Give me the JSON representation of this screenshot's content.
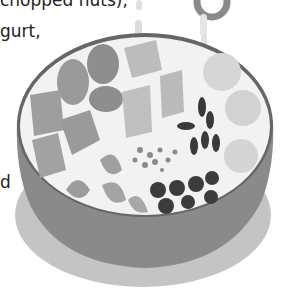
{
  "text_fragments": {
    "line1": "chopped nuts),",
    "line2": "gurt,",
    "line3": "d"
  },
  "illustration": {
    "subject": "bowl of yogurt with toppings",
    "toppings": [
      "mango cubes",
      "plums/eggs",
      "pineapple chunks",
      "banana slices",
      "raisins",
      "blueberries",
      "strawberries",
      "chopped nuts/seeds"
    ],
    "style": "grayscale"
  },
  "colors": {
    "bowl_side": "#8a8a8a",
    "bowl_shadow": "#c4c4c4",
    "bowl_rim": "#666666",
    "yogurt": "#f2f2f2",
    "dark_fruit": "#3a3a3a",
    "mid_fruit": "#a8a8a8",
    "light_fruit": "#d6d6d6"
  }
}
